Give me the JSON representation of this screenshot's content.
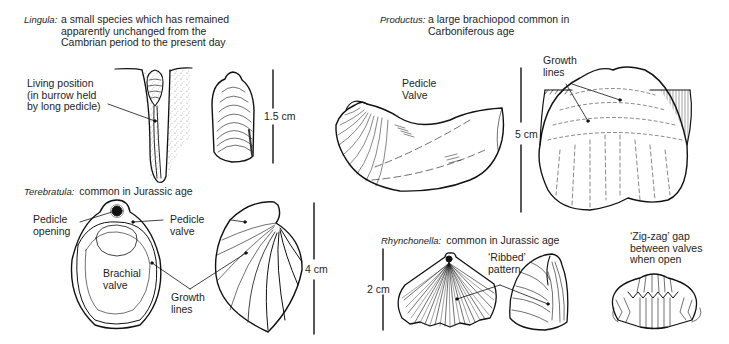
{
  "figure": {
    "specimens": [
      {
        "id": "lingula",
        "name": "Lingula",
        "caption_lines": [
          "a small species which has remained",
          "apparently unchanged from the",
          "Cambrian period to the present day"
        ],
        "labels": [
          {
            "text_lines": [
              "Living position",
              "(in burrow held",
              "by long pedicle)"
            ]
          }
        ],
        "scale": "1.5 cm"
      },
      {
        "id": "productus",
        "name": "Productus",
        "caption_lines": [
          "a large brachiopod common in",
          "Carboniferous age"
        ],
        "labels": [
          {
            "text_lines": [
              "Pedicle",
              "Valve"
            ]
          },
          {
            "text_lines": [
              "Growth",
              "lines"
            ]
          }
        ],
        "scale": "5 cm"
      },
      {
        "id": "terebratula",
        "name": "Terebratula",
        "caption_lines": [
          "common in Jurassic age"
        ],
        "labels": [
          {
            "text_lines": [
              "Pedicle",
              "opening"
            ]
          },
          {
            "text_lines": [
              "Pedicle",
              "valve"
            ]
          },
          {
            "text_lines": [
              "Brachial",
              "valve"
            ]
          },
          {
            "text_lines": [
              "Growth",
              "lines"
            ]
          }
        ],
        "scale": "4 cm"
      },
      {
        "id": "rhynchonella",
        "name": "Rhynchonella",
        "caption_lines": [
          "common in Jurassic age"
        ],
        "labels": [
          {
            "text_lines": [
              "‘Ribbed’",
              "pattern"
            ]
          },
          {
            "text_lines": [
              "‘Zig-zag’ gap",
              "between valves",
              "when open"
            ]
          }
        ],
        "scale": "2 cm"
      }
    ]
  }
}
